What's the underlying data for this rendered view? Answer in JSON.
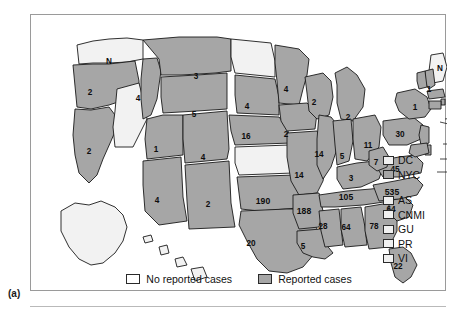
{
  "figure": {
    "panel_label": "(a)"
  },
  "chart_data": {
    "type": "map",
    "title": "",
    "subtitle": "",
    "legend_position": "bottom-center and right-side",
    "value_units": "reported cases",
    "categories": [
      "Washington",
      "Oregon",
      "California",
      "Nevada",
      "Idaho",
      "Montana",
      "Wyoming",
      "Utah",
      "Arizona",
      "Colorado",
      "New Mexico",
      "North Dakota",
      "South Dakota",
      "Nebraska",
      "Kansas",
      "Oklahoma",
      "Texas",
      "Minnesota",
      "Iowa",
      "Missouri",
      "Arkansas",
      "Louisiana",
      "Wisconsin",
      "Illinois",
      "Michigan",
      "Indiana",
      "Ohio",
      "Kentucky",
      "Tennessee",
      "Mississippi",
      "Alabama",
      "Georgia",
      "Florida",
      "South Carolina",
      "North Carolina",
      "Virginia",
      "West Virginia",
      "Pennsylvania",
      "New York",
      "Maine",
      "New Hampshire",
      "Vermont",
      "Massachusetts",
      "Rhode Island",
      "Connecticut",
      "New Jersey",
      "Delaware",
      "Maryland",
      "Alaska",
      "Hawaii"
    ],
    "values": [
      null,
      2,
      2,
      null,
      4,
      3,
      5,
      1,
      4,
      4,
      2,
      null,
      4,
      14,
      null,
      190,
      20,
      4,
      2,
      14,
      188,
      5,
      2,
      14,
      2,
      5,
      11,
      3,
      105,
      28,
      64,
      78,
      22,
      64,
      535,
      45,
      7,
      30,
      1,
      null,
      1,
      15,
      7,
      3,
      14,
      14,
      6,
      75,
      null,
      null
    ],
    "no_data_marker": "N",
    "states": [
      {
        "code": "WA",
        "name": "Washington",
        "value": "N",
        "reported": false,
        "x": 78,
        "y": 47
      },
      {
        "code": "OR",
        "name": "Oregon",
        "value": "2",
        "reported": true,
        "x": 59,
        "y": 78
      },
      {
        "code": "CA",
        "name": "California",
        "value": "2",
        "reported": true,
        "x": 58,
        "y": 137
      },
      {
        "code": "NV",
        "name": "Nevada",
        "value": "",
        "reported": false,
        "x": 96,
        "y": 118
      },
      {
        "code": "ID",
        "name": "Idaho",
        "value": "4",
        "reported": true,
        "x": 107,
        "y": 84
      },
      {
        "code": "MT",
        "name": "Montana",
        "value": "3",
        "reported": true,
        "x": 165,
        "y": 62
      },
      {
        "code": "WY",
        "name": "Wyoming",
        "value": "5",
        "reported": true,
        "x": 163,
        "y": 100
      },
      {
        "code": "UT",
        "name": "Utah",
        "value": "1",
        "reported": true,
        "x": 125,
        "y": 135
      },
      {
        "code": "AZ",
        "name": "Arizona",
        "value": "4",
        "reported": true,
        "x": 126,
        "y": 186
      },
      {
        "code": "CO",
        "name": "Colorado",
        "value": "4",
        "reported": true,
        "x": 172,
        "y": 143
      },
      {
        "code": "NM",
        "name": "New Mexico",
        "value": "2",
        "reported": true,
        "x": 177,
        "y": 190
      },
      {
        "code": "ND",
        "name": "North Dakota",
        "value": "",
        "reported": false,
        "x": 215,
        "y": 57
      },
      {
        "code": "SD",
        "name": "South Dakota",
        "value": "4",
        "reported": true,
        "x": 216,
        "y": 92
      },
      {
        "code": "NE",
        "name": "Nebraska",
        "value": "16",
        "reported": true,
        "x": 215,
        "y": 122
      },
      {
        "code": "KS",
        "name": "Kansas",
        "value": "",
        "reported": false,
        "x": 219,
        "y": 159
      },
      {
        "code": "OK",
        "name": "Oklahoma",
        "value": "190",
        "reported": true,
        "x": 232,
        "y": 186
      },
      {
        "code": "TX",
        "name": "Texas",
        "value": "20",
        "reported": true,
        "x": 220,
        "y": 229
      },
      {
        "code": "MN",
        "name": "Minnesota",
        "value": "4",
        "reported": true,
        "x": 255,
        "y": 75
      },
      {
        "code": "IA",
        "name": "Iowa",
        "value": "2",
        "reported": true,
        "x": 255,
        "y": 120
      },
      {
        "code": "MO",
        "name": "Missouri",
        "value": "14",
        "reported": true,
        "x": 268,
        "y": 161
      },
      {
        "code": "AR",
        "name": "Arkansas",
        "value": "188",
        "reported": true,
        "x": 273,
        "y": 196
      },
      {
        "code": "LA",
        "name": "Louisiana",
        "value": "5",
        "reported": true,
        "x": 272,
        "y": 232
      },
      {
        "code": "WI",
        "name": "Wisconsin",
        "value": "2",
        "reported": true,
        "x": 283,
        "y": 88
      },
      {
        "code": "IL",
        "name": "Illinois",
        "value": "14",
        "reported": true,
        "x": 288,
        "y": 140
      },
      {
        "code": "MI",
        "name": "Michigan",
        "value": "2",
        "reported": true,
        "x": 317,
        "y": 103
      },
      {
        "code": "IN",
        "name": "Indiana",
        "value": "5",
        "reported": true,
        "x": 311,
        "y": 142
      },
      {
        "code": "OH",
        "name": "Ohio",
        "value": "11",
        "reported": true,
        "x": 337,
        "y": 131
      },
      {
        "code": "KY",
        "name": "Kentucky",
        "value": "3",
        "reported": true,
        "x": 320,
        "y": 164
      },
      {
        "code": "TN",
        "name": "Tennessee",
        "value": "105",
        "reported": true,
        "x": 315,
        "y": 182
      },
      {
        "code": "MS",
        "name": "Mississippi",
        "value": "28",
        "reported": true,
        "x": 292,
        "y": 212
      },
      {
        "code": "AL",
        "name": "Alabama",
        "value": "64",
        "reported": true,
        "x": 315,
        "y": 213
      },
      {
        "code": "GA",
        "name": "Georgia",
        "value": "78",
        "reported": true,
        "x": 343,
        "y": 212
      },
      {
        "code": "FL",
        "name": "Florida",
        "value": "22",
        "reported": true,
        "x": 367,
        "y": 252
      },
      {
        "code": "SC",
        "name": "South Carolina",
        "value": "64",
        "reported": true,
        "x": 360,
        "y": 195
      },
      {
        "code": "NC",
        "name": "North Carolina",
        "value": "535",
        "reported": true,
        "x": 361,
        "y": 177
      },
      {
        "code": "VA",
        "name": "Virginia",
        "value": "45",
        "reported": true,
        "x": 364,
        "y": 155
      },
      {
        "code": "WV",
        "name": "West Virginia",
        "value": "7",
        "reported": true,
        "x": 345,
        "y": 148
      },
      {
        "code": "PA",
        "name": "Pennsylvania",
        "value": "30",
        "reported": true,
        "x": 369,
        "y": 120
      },
      {
        "code": "NY",
        "name": "New York",
        "value": "1",
        "reported": true,
        "x": 384,
        "y": 93
      },
      {
        "code": "ME",
        "name": "Maine",
        "value": "N",
        "reported": false,
        "x": 409,
        "y": 54
      },
      {
        "code": "NH",
        "name": "New Hampshire",
        "value": "1",
        "reported": true,
        "x": 398,
        "y": 75
      }
    ],
    "callouts": [
      {
        "code": "VT",
        "name": "Vermont",
        "value": "15",
        "reported": true,
        "x": 432,
        "y": 92,
        "leader_from_x": 418,
        "leader_from_y": 99
      },
      {
        "code": "MA",
        "name": "Massachusetts",
        "value": "7",
        "reported": true,
        "x": 432,
        "y": 102,
        "leader_from_x": 414,
        "leader_from_y": 104
      },
      {
        "code": "RI",
        "name": "Rhode Island",
        "value": "3",
        "reported": true,
        "x": 432,
        "y": 112,
        "leader_from_x": 409,
        "leader_from_y": 107
      },
      {
        "code": "CT",
        "name": "Connecticut",
        "value": "14",
        "reported": true,
        "x": 430,
        "y": 129,
        "leader_from_x": 412,
        "leader_from_y": 129
      },
      {
        "code": "NJ",
        "name": "New Jersey",
        "value": "6",
        "reported": true,
        "x": 430,
        "y": 144,
        "leader_from_x": 409,
        "leader_from_y": 144
      },
      {
        "code": "DE",
        "name": "Delaware",
        "value": "75",
        "reported": true,
        "x": 429,
        "y": 157,
        "leader_from_x": 406,
        "leader_from_y": 157
      }
    ],
    "non_state_legend": [
      {
        "code": "DC",
        "label": "DC",
        "reported": false,
        "swatch": "light"
      },
      {
        "code": "NYC",
        "label": "NYC",
        "reported": true,
        "swatch": "gray"
      }
    ],
    "territory_legend": [
      {
        "code": "AS",
        "label": "AS",
        "reported": false,
        "swatch": "light"
      },
      {
        "code": "CNMI",
        "label": "CNMI",
        "reported": false,
        "swatch": "light"
      },
      {
        "code": "GU",
        "label": "GU",
        "reported": false,
        "swatch": "light"
      },
      {
        "code": "PR",
        "label": "PR",
        "reported": false,
        "swatch": "light"
      },
      {
        "code": "VI",
        "label": "VI",
        "reported": false,
        "swatch": "light"
      }
    ],
    "legend": [
      {
        "label": "No reported cases",
        "swatch": "light",
        "color": "#ffffff"
      },
      {
        "label": "Reported cases",
        "swatch": "gray",
        "color": "#a6a6a6"
      }
    ],
    "colors": {
      "reported_fill": "#a6a6a6",
      "no_reported_fill": "#f2f2f2",
      "outline": "#1a1a1a",
      "frame": "#9a9a9a",
      "text": "#0d0d0d"
    }
  }
}
